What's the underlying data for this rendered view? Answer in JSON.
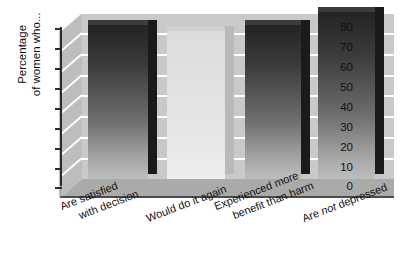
{
  "chart_data": {
    "type": "bar",
    "title": "",
    "subtitle": "",
    "xlabel": "",
    "ylabel": "Percentage of women who...",
    "ylabel_line1": "Percentage",
    "ylabel_line2": "of women who...",
    "ylim": [
      0,
      80
    ],
    "ytick_step": 10,
    "grid": true,
    "legend": "none",
    "style": "3d-column",
    "categories": [
      "Are satisfied with decision",
      "Would do it again",
      "Experienced more benefit than harm",
      "Are not depressed"
    ],
    "category_lines": [
      [
        "Are satisfied",
        "with decision"
      ],
      [
        "Would do it again",
        ""
      ],
      [
        "Experienced more",
        "benefit than harm"
      ],
      [
        "Are not depressed",
        ""
      ]
    ],
    "values": [
      74,
      71,
      74,
      80
    ],
    "ytick_labels": [
      "80",
      "70",
      "60",
      "50",
      "40",
      "30",
      "20",
      "10",
      "0"
    ],
    "series": [
      {
        "name": "Percentage of women who...",
        "values": [
          74,
          71,
          74,
          80
        ]
      }
    ],
    "bar_shades": [
      "dark",
      "light",
      "dark",
      "dark"
    ],
    "colors": {
      "bar_dark_top": "#242424",
      "bar_dark_bottom": "#bdbdbd",
      "bar_light_top": "#dcdcdc",
      "bar_light_bottom": "#ededed",
      "back_wall": "#c9c9c9",
      "side_wall": "#bcbcbc",
      "floor": "#a9a9a9",
      "gridline": "#ffffff",
      "axis": "#2b2b2b",
      "text": "#101010",
      "background": "#ffffff"
    }
  }
}
